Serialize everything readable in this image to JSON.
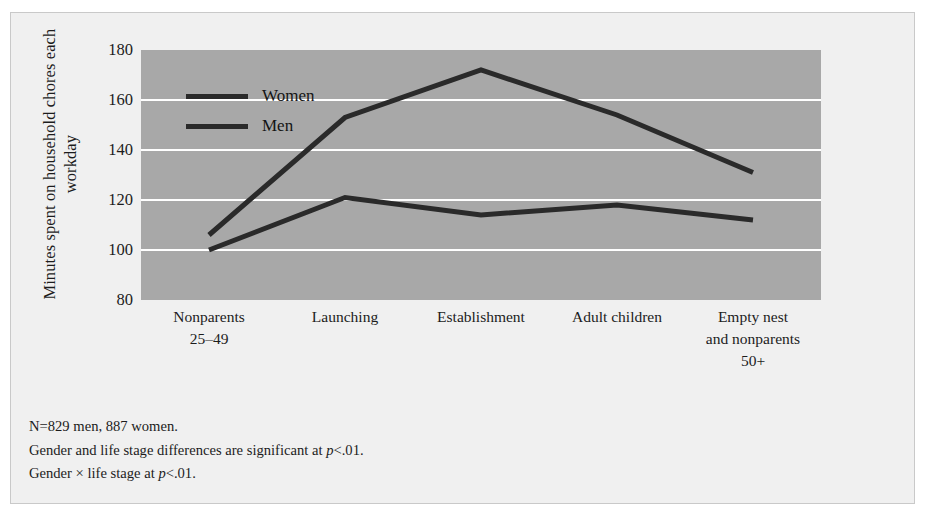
{
  "figure": {
    "y_axis_title_line1": "Minutes spent on household",
    "y_axis_title_line2": "chores each workday",
    "background_color": "#f0f0f0",
    "plot_background_color": "#a8a8a8",
    "gridline_color": "#ffffff",
    "line_color": "#2a2a2a"
  },
  "legend": {
    "items": [
      {
        "label": "Women",
        "swatch_color": "#2a2a2a"
      },
      {
        "label": "Men",
        "swatch_color": "#2a2a2a"
      }
    ]
  },
  "footnotes": {
    "line1": "N=829 men, 887 women.",
    "line2_pre": "Gender and life stage differences are significant at ",
    "line2_italic": "p",
    "line2_post": "<.01.",
    "line3_pre": "Gender × life stage at ",
    "line3_italic": "p",
    "line3_post": "<.01."
  },
  "chart_data": {
    "type": "line",
    "title": "",
    "xlabel": "",
    "ylabel": "Minutes spent on household chores each workday",
    "ylim": [
      80,
      180
    ],
    "yticks": [
      180,
      160,
      140,
      120,
      100,
      80
    ],
    "grid": true,
    "legend_position": "upper-left-inside",
    "categories": [
      "Nonparents 25–49",
      "Launching",
      "Establishment",
      "Adult children",
      "Empty nest and nonparents 50+"
    ],
    "category_label_lines": [
      [
        "Nonparents",
        "25–49"
      ],
      [
        "Launching"
      ],
      [
        "Establishment"
      ],
      [
        "Adult children"
      ],
      [
        "Empty nest",
        "and nonparents",
        "50+"
      ]
    ],
    "series": [
      {
        "name": "Women",
        "values": [
          106,
          153,
          172,
          154,
          131
        ]
      },
      {
        "name": "Men",
        "values": [
          100,
          121,
          114,
          118,
          112
        ]
      }
    ]
  }
}
